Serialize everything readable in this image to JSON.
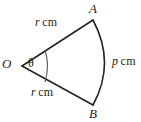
{
  "figure": {
    "name": "circular-sector-diagram",
    "stroke_color": "#232323",
    "background_color": "#ffffff",
    "labels": {
      "centre_point": "O",
      "arc_start_point": "A",
      "arc_end_point": "B",
      "angle": "θ",
      "radius_top": {
        "symbol": "r",
        "unit": "cm"
      },
      "radius_bottom": {
        "symbol": "r",
        "unit": "cm"
      },
      "arc_length": {
        "symbol": "p",
        "unit": "cm"
      }
    }
  },
  "geometry": {
    "centre": {
      "x": 22,
      "y": 66
    },
    "point_a": {
      "x": 93,
      "y": 20
    },
    "point_b": {
      "x": 93,
      "y": 105
    },
    "arc_bulge_x": 110,
    "angle_marker_radius": 24
  }
}
